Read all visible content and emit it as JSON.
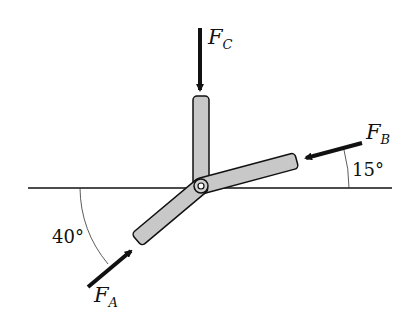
{
  "diagram": {
    "type": "force-free-body",
    "forces": {
      "A": {
        "symbol": "F",
        "subscript": "A",
        "angle_label": "40°"
      },
      "B": {
        "symbol": "F",
        "subscript": "B",
        "angle_label": "15°"
      },
      "C": {
        "symbol": "F",
        "subscript": "C"
      }
    },
    "colors": {
      "member_fill": "#c8c8c8",
      "stroke": "#111111",
      "background": "#ffffff"
    }
  }
}
